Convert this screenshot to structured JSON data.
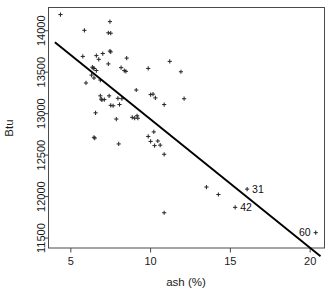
{
  "chart_data": {
    "type": "scatter",
    "title": "",
    "xlabel": "ash (%)",
    "ylabel": "Btu",
    "xlim": [
      3.6,
      20.9
    ],
    "ylim": [
      11380,
      14280
    ],
    "xticks": [
      5,
      10,
      15,
      20
    ],
    "xtick_labels": [
      "5",
      "10",
      "15",
      "20"
    ],
    "yticks": [
      11500,
      12000,
      12500,
      13000,
      13500,
      14000
    ],
    "ytick_labels": [
      "11500",
      "12000",
      "12500",
      "13000",
      "13500",
      "14000"
    ],
    "grid": false,
    "legend": null,
    "marker": "plus",
    "points": [
      {
        "x": 4.35,
        "y": 14195
      },
      {
        "x": 5.85,
        "y": 14005
      },
      {
        "x": 7.45,
        "y": 14110
      },
      {
        "x": 7.35,
        "y": 13975
      },
      {
        "x": 7.5,
        "y": 13970
      },
      {
        "x": 5.75,
        "y": 13690
      },
      {
        "x": 6.6,
        "y": 13700
      },
      {
        "x": 7.0,
        "y": 13725
      },
      {
        "x": 7.45,
        "y": 13755
      },
      {
        "x": 7.5,
        "y": 13745
      },
      {
        "x": 6.75,
        "y": 13655
      },
      {
        "x": 6.35,
        "y": 13560
      },
      {
        "x": 6.4,
        "y": 13550
      },
      {
        "x": 6.45,
        "y": 13545
      },
      {
        "x": 6.6,
        "y": 13520
      },
      {
        "x": 7.35,
        "y": 13600
      },
      {
        "x": 8.15,
        "y": 13555
      },
      {
        "x": 8.35,
        "y": 13520
      },
      {
        "x": 8.45,
        "y": 13510
      },
      {
        "x": 8.5,
        "y": 13670
      },
      {
        "x": 6.3,
        "y": 13465
      },
      {
        "x": 6.45,
        "y": 13430
      },
      {
        "x": 5.95,
        "y": 13370
      },
      {
        "x": 6.85,
        "y": 13405
      },
      {
        "x": 9.85,
        "y": 13545
      },
      {
        "x": 11.2,
        "y": 13630
      },
      {
        "x": 11.9,
        "y": 13505
      },
      {
        "x": 6.85,
        "y": 13215
      },
      {
        "x": 6.9,
        "y": 13175
      },
      {
        "x": 6.95,
        "y": 13165
      },
      {
        "x": 7.1,
        "y": 13170
      },
      {
        "x": 7.4,
        "y": 13215
      },
      {
        "x": 7.5,
        "y": 13100
      },
      {
        "x": 7.65,
        "y": 13095
      },
      {
        "x": 7.95,
        "y": 13185
      },
      {
        "x": 8.05,
        "y": 13110
      },
      {
        "x": 8.2,
        "y": 13180
      },
      {
        "x": 9.1,
        "y": 13285
      },
      {
        "x": 10.0,
        "y": 13230
      },
      {
        "x": 10.15,
        "y": 13235
      },
      {
        "x": 10.3,
        "y": 13190
      },
      {
        "x": 10.85,
        "y": 13110
      },
      {
        "x": 12.1,
        "y": 13180
      },
      {
        "x": 6.55,
        "y": 13010
      },
      {
        "x": 7.85,
        "y": 12935
      },
      {
        "x": 8.85,
        "y": 12955
      },
      {
        "x": 9.0,
        "y": 12945
      },
      {
        "x": 9.15,
        "y": 12975
      },
      {
        "x": 9.2,
        "y": 12945
      },
      {
        "x": 6.45,
        "y": 12715
      },
      {
        "x": 6.5,
        "y": 12705
      },
      {
        "x": 8.0,
        "y": 12635
      },
      {
        "x": 9.85,
        "y": 12725
      },
      {
        "x": 10.0,
        "y": 12665
      },
      {
        "x": 10.2,
        "y": 12780
      },
      {
        "x": 10.25,
        "y": 12615
      },
      {
        "x": 10.45,
        "y": 12670
      },
      {
        "x": 10.6,
        "y": 12620
      },
      {
        "x": 10.85,
        "y": 12510
      },
      {
        "x": 10.85,
        "y": 11805
      },
      {
        "x": 13.5,
        "y": 12115
      },
      {
        "x": 14.25,
        "y": 12025
      }
    ],
    "labeled_points": [
      {
        "label": "31",
        "x": 16.05,
        "y": 12090,
        "label_side": "right"
      },
      {
        "label": "42",
        "x": 15.3,
        "y": 11870,
        "label_side": "right"
      },
      {
        "label": "60",
        "x": 20.35,
        "y": 11565,
        "label_side": "left"
      }
    ],
    "regression_line": {
      "x1": 4.0,
      "y1": 13860,
      "x2": 20.65,
      "y2": 11280
    }
  }
}
